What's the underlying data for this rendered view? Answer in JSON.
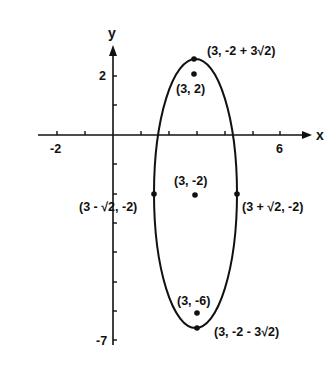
{
  "figure": {
    "type": "ellipse-graph",
    "colors": {
      "ink": "#111111",
      "background": "#ffffff"
    },
    "axes": {
      "x_label": "x",
      "y_label": "y",
      "x_ticks_labeled": [
        {
          "value": -2,
          "label": "-2"
        },
        {
          "value": 6,
          "label": "6"
        }
      ],
      "y_ticks_labeled": [
        {
          "value": 2,
          "label": "2"
        },
        {
          "value": -7,
          "label": "-7"
        }
      ],
      "x_range": [
        -2.5,
        7
      ],
      "y_range": [
        -7.2,
        3.2
      ],
      "tick_step": 1
    },
    "ellipse": {
      "center": [
        3,
        -2
      ],
      "semi_major_vertical": 4.2426,
      "semi_minor_horizontal": 1.4142,
      "equation_hint": "(x-3)^2/2 + (y+2)^2/18 = 1"
    },
    "points": [
      {
        "id": "top-vertex",
        "label": "(3, -2 + 3√2)",
        "x": 3,
        "y": 2.2426
      },
      {
        "id": "focus-upper",
        "label": "(3, 2)",
        "x": 3,
        "y": 2
      },
      {
        "id": "center",
        "label": "(3, -2)",
        "x": 3,
        "y": -2
      },
      {
        "id": "left-covertex",
        "label": "(3 - √2, -2)",
        "x": 1.5858,
        "y": -2
      },
      {
        "id": "right-covertex",
        "label": "(3 + √2, -2)",
        "x": 4.4142,
        "y": -2
      },
      {
        "id": "focus-lower",
        "label": "(3, -6)",
        "x": 3,
        "y": -6
      },
      {
        "id": "bottom-vertex",
        "label": "(3, -2 - 3√2)",
        "x": 3,
        "y": -6.2426
      }
    ]
  }
}
